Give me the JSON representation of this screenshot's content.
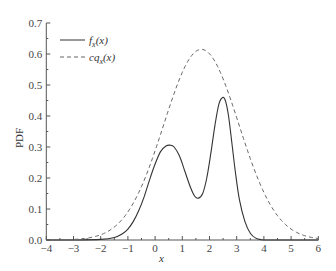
{
  "chart_data": {
    "type": "line",
    "title": "",
    "xlabel": "x",
    "ylabel": "PDF",
    "xlim": [
      -4,
      6
    ],
    "ylim": [
      0,
      0.7
    ],
    "grid": false,
    "legend_position": "upper-left",
    "x_ticks": [
      -4,
      -3,
      -2,
      -1,
      0,
      1,
      2,
      3,
      4,
      5,
      6
    ],
    "x_tick_labels": [
      "-4",
      "-3",
      "-2",
      "-1",
      "0",
      "1",
      "2",
      "3",
      "4",
      "5",
      "6"
    ],
    "y_ticks": [
      0.0,
      0.1,
      0.2,
      0.3,
      0.4,
      0.5,
      0.6,
      0.7
    ],
    "y_tick_labels": [
      "0.0",
      "0.1",
      "0.2",
      "0.3",
      "0.4",
      "0.5",
      "0.6",
      "0.7"
    ],
    "series": [
      {
        "name": "f_x(x)",
        "legend_main": "f",
        "legend_sub": "x",
        "legend_tail": "(x)",
        "style": "solid",
        "color": "#333333",
        "x": [
          -4,
          -3,
          -2,
          -1.5,
          -1.2,
          -1,
          -0.8,
          -0.6,
          -0.4,
          -0.2,
          0,
          0.2,
          0.4,
          0.55,
          0.7,
          0.9,
          1.1,
          1.3,
          1.45,
          1.6,
          1.75,
          1.9,
          2.05,
          2.2,
          2.35,
          2.5,
          2.6,
          2.7,
          2.8,
          2.95,
          3.1,
          3.3,
          3.5,
          3.7,
          3.9,
          4.2,
          5,
          6
        ],
        "y": [
          0,
          0,
          0.002,
          0.008,
          0.02,
          0.035,
          0.06,
          0.095,
          0.14,
          0.195,
          0.245,
          0.285,
          0.303,
          0.306,
          0.3,
          0.27,
          0.22,
          0.17,
          0.142,
          0.135,
          0.15,
          0.2,
          0.28,
          0.37,
          0.44,
          0.46,
          0.445,
          0.4,
          0.33,
          0.22,
          0.13,
          0.06,
          0.022,
          0.006,
          0.001,
          0,
          0,
          0
        ]
      },
      {
        "name": "cq_x(x)",
        "legend_main": "cq",
        "legend_sub": "x",
        "legend_tail": "(x)",
        "style": "dashed",
        "color": "#666666",
        "gaussian": {
          "amplitude": 0.615,
          "mean": 1.7,
          "sigma": 1.38
        }
      }
    ]
  }
}
